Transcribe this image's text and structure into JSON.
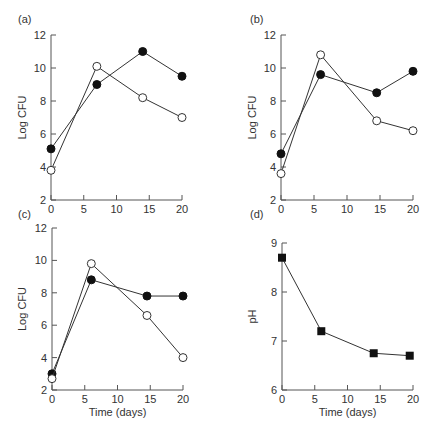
{
  "chart_data": [
    {
      "panel": "(a)",
      "type": "line",
      "title": "",
      "xlabel": "",
      "ylabel": "Log CFU",
      "xlim": [
        0,
        20
      ],
      "ylim": [
        2,
        12
      ],
      "xticks": [
        0,
        5,
        10,
        15,
        20
      ],
      "yticks": [
        2,
        4,
        6,
        8,
        10,
        12
      ],
      "grid": false,
      "series": [
        {
          "name": "filled circles",
          "marker": "filled-circle",
          "x": [
            0,
            7,
            14,
            20
          ],
          "y": [
            5.1,
            9.0,
            11.0,
            9.5
          ]
        },
        {
          "name": "open circles",
          "marker": "open-circle",
          "x": [
            0,
            7,
            14,
            20
          ],
          "y": [
            3.8,
            10.1,
            8.2,
            7.0
          ]
        }
      ]
    },
    {
      "panel": "(b)",
      "type": "line",
      "title": "",
      "xlabel": "",
      "ylabel": "Log CFU",
      "xlim": [
        0,
        20
      ],
      "ylim": [
        2,
        12
      ],
      "xticks": [
        0,
        5,
        10,
        15,
        20
      ],
      "yticks": [
        2,
        4,
        6,
        8,
        10,
        12
      ],
      "grid": false,
      "series": [
        {
          "name": "filled circles",
          "marker": "filled-circle",
          "x": [
            0,
            6,
            14.5,
            20
          ],
          "y": [
            4.8,
            9.6,
            8.5,
            9.8
          ]
        },
        {
          "name": "open circles",
          "marker": "open-circle",
          "x": [
            0,
            6,
            14.5,
            20
          ],
          "y": [
            3.6,
            10.8,
            6.8,
            6.2
          ]
        }
      ]
    },
    {
      "panel": "(c)",
      "type": "line",
      "title": "",
      "xlabel": "Time (days)",
      "ylabel": "Log CFU",
      "xlim": [
        0,
        20
      ],
      "ylim": [
        2,
        12
      ],
      "xticks": [
        0,
        5,
        10,
        15,
        20
      ],
      "yticks": [
        2,
        4,
        6,
        8,
        10,
        12
      ],
      "grid": false,
      "series": [
        {
          "name": "filled circles",
          "marker": "filled-circle",
          "x": [
            0,
            6,
            14.5,
            20
          ],
          "y": [
            3.0,
            8.8,
            7.8,
            7.8
          ]
        },
        {
          "name": "open circles",
          "marker": "open-circle",
          "x": [
            0,
            6,
            14.5,
            20
          ],
          "y": [
            2.7,
            9.8,
            6.6,
            4.0
          ]
        }
      ]
    },
    {
      "panel": "(d)",
      "type": "line",
      "title": "",
      "xlabel": "Time (days)",
      "ylabel": "pH",
      "xlim": [
        0,
        20
      ],
      "ylim": [
        6,
        9
      ],
      "xticks": [
        0,
        5,
        10,
        15,
        20
      ],
      "yticks": [
        6,
        7,
        8,
        9
      ],
      "grid": false,
      "series": [
        {
          "name": "pH",
          "marker": "filled-square",
          "x": [
            0,
            6,
            14,
            19.5
          ],
          "y": [
            8.7,
            7.2,
            6.75,
            6.7
          ]
        }
      ]
    }
  ]
}
